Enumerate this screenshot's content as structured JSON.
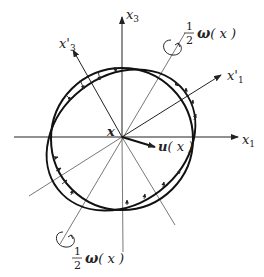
{
  "diagram": {
    "origin": {
      "x": 122,
      "y": 137
    },
    "axes": {
      "x1": {
        "label_base": "x",
        "label_sub": "1"
      },
      "x3": {
        "label_base": "x",
        "label_sub": "3"
      },
      "x1_prime": {
        "label_base": "x'",
        "label_sub": "1"
      },
      "x3_prime": {
        "label_base": "x'",
        "label_sub": "3"
      }
    },
    "point_label": "x",
    "displacement_label": {
      "symbol": "u",
      "arg": "( x )"
    },
    "rotation_label_top": {
      "num": "1",
      "den": "2",
      "symbol": "ω",
      "arg": "( x )"
    },
    "rotation_label_bottom": {
      "num": "1",
      "den": "2",
      "symbol": "ω",
      "arg": "( x )"
    },
    "colors": {
      "line": "#222222",
      "thin": "#555555",
      "background": "#ffffff"
    }
  }
}
